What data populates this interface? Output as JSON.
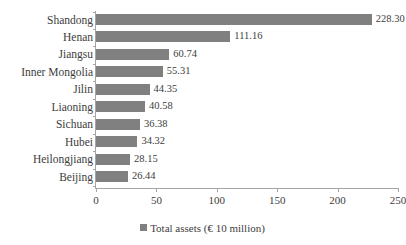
{
  "chart_data": {
    "type": "bar",
    "orientation": "horizontal",
    "title": "",
    "subtitle": "",
    "xlabel": "",
    "ylabel": "",
    "xlim": [
      0,
      250
    ],
    "xticks": [
      0,
      50,
      100,
      150,
      200,
      250
    ],
    "grid": false,
    "legend_position": "bottom",
    "categories": [
      "Shandong",
      "Henan",
      "Jiangsu",
      "Inner Mongolia",
      "Jilin",
      "Liaoning",
      "Sichuan",
      "Hubei",
      "Heilongjiang",
      "Beijing"
    ],
    "values": [
      228.3,
      111.16,
      60.74,
      55.31,
      44.35,
      40.58,
      36.38,
      34.32,
      28.15,
      26.44
    ],
    "value_labels": [
      "228.30",
      "111.16",
      "60.74",
      "55.31",
      "44.35",
      "40.58",
      "36.38",
      "34.32",
      "28.15",
      "26.44"
    ],
    "series": [
      {
        "name": "Total assets (€ 10 million)",
        "color": "#808080",
        "values": [
          228.3,
          111.16,
          60.74,
          55.31,
          44.35,
          40.58,
          36.38,
          34.32,
          28.15,
          26.44
        ]
      }
    ],
    "legend": [
      {
        "label": "Total assets (€ 10 million)",
        "color": "#808080",
        "marker": "square"
      }
    ]
  },
  "colors": {
    "bar": "#808080",
    "axis": "#a6a6a6",
    "text": "#3d3d3d",
    "background": "#ffffff"
  }
}
